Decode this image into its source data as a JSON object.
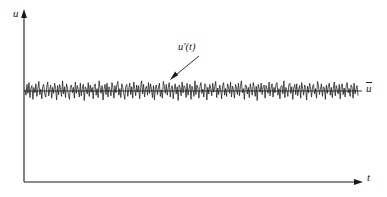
{
  "figure": {
    "type": "turbulent-velocity-signal",
    "background_color": "#ffffff",
    "line_color": "#1a1a1a"
  },
  "labels": {
    "y_axis": "u",
    "x_axis": "t",
    "signal": "u′(t)",
    "mean": "u"
  },
  "chart_data": {
    "type": "line",
    "title": "",
    "subtitle": "",
    "xlabel": "t",
    "ylabel": "u",
    "grid": false,
    "legend": "none",
    "annotations": [
      {
        "text": "u′(t)",
        "label_x_px": 178,
        "label_y_px": 42,
        "arrow_from_px": [
          199,
          56
        ],
        "arrow_to_px": [
          171,
          79
        ]
      },
      {
        "text": "ū",
        "label_x_px": 366,
        "label_y_px": 83,
        "meaning": "time-averaged mean velocity"
      }
    ],
    "axes_px": {
      "origin": [
        24,
        182
      ],
      "y_axis_top": [
        24,
        12
      ],
      "x_axis_right": [
        362,
        182
      ],
      "arrowheads": true
    },
    "series": [
      {
        "name": "mean",
        "style": "solid-horizontal",
        "y_px": 91,
        "x_start_px": 24,
        "x_end_px": 362,
        "value": 0
      },
      {
        "name": "u'(t)",
        "style": "solid-noise",
        "description": "high-frequency random turbulent fluctuation about the mean",
        "x_start_px": 25,
        "x_end_px": 358,
        "mean_y_px": 91,
        "amplitude_px": 12,
        "samples": 336,
        "values": [
          0.1,
          -0.35,
          0.55,
          -0.2,
          0.7,
          -0.55,
          0.25,
          0.45,
          -0.7,
          0.3,
          -0.15,
          0.6,
          -0.45,
          0.2,
          0.8,
          -0.3,
          0.15,
          -0.65,
          0.4,
          0.55,
          -0.25,
          -0.5,
          0.35,
          0.75,
          -0.4,
          0.1,
          0.5,
          -0.6,
          0.3,
          -0.2,
          0.65,
          0.2,
          -0.75,
          0.45,
          -0.3,
          0.55,
          0.15,
          -0.45,
          0.85,
          -0.25,
          0.35,
          -0.55,
          0.6,
          0.25,
          -0.35,
          -0.7,
          0.4,
          0.5,
          -0.15,
          0.3,
          -0.6,
          0.75,
          -0.2,
          0.45,
          0.1,
          -0.5,
          0.65,
          -0.4,
          0.2,
          0.55,
          -0.8,
          0.35,
          0.15,
          -0.25,
          0.7,
          -0.45,
          0.5,
          -0.1,
          0.3,
          -0.65,
          0.4,
          0.6,
          -0.35,
          0.2,
          -0.55,
          0.85,
          0.25,
          -0.2,
          0.45,
          -0.75,
          0.15,
          0.55,
          -0.3,
          0.65,
          -0.5,
          0.35,
          0.1,
          -0.4,
          0.7,
          0.25,
          -0.6,
          0.45,
          -0.15,
          0.5,
          0.8,
          -0.35,
          0.2,
          -0.55,
          0.6,
          0.3,
          -0.25,
          -0.7,
          0.4,
          0.55,
          -0.45,
          0.15,
          0.65,
          -0.3,
          0.35,
          -0.6,
          0.75,
          0.2,
          -0.4,
          0.5,
          -0.1,
          0.45,
          -0.65,
          0.3,
          0.85,
          -0.25,
          0.55,
          -0.5,
          0.2,
          0.4,
          -0.35,
          0.7,
          -0.2,
          0.6,
          0.15,
          -0.55,
          0.45,
          -0.75,
          0.35,
          0.5,
          -0.3,
          0.25,
          0.65,
          -0.45,
          0.1,
          -0.6,
          0.8,
          0.4,
          -0.2,
          0.55,
          -0.35,
          0.3,
          0.7,
          -0.5,
          0.2,
          0.45,
          -0.65,
          0.15,
          0.6,
          -0.25,
          0.35,
          -0.8,
          0.5,
          0.25,
          -0.4,
          0.75,
          -0.15,
          0.45,
          0.3,
          -0.55,
          0.65,
          -0.35,
          0.2,
          0.55,
          -0.7,
          0.4,
          0.1,
          -0.45,
          0.85,
          -0.3,
          0.5,
          0.25,
          -0.6,
          0.35,
          0.7,
          -0.2,
          0.15,
          -0.5,
          0.6,
          0.45,
          -0.75,
          0.3,
          -0.25,
          0.55,
          0.2,
          -0.4,
          0.65,
          -0.1,
          0.35,
          0.8,
          -0.55,
          0.25,
          -0.3,
          0.5,
          0.15,
          -0.65,
          0.45,
          0.7,
          -0.35,
          0.2,
          -0.45,
          0.6,
          0.3,
          -0.2,
          0.75,
          -0.5,
          0.4,
          0.1,
          -0.6,
          0.55,
          0.25,
          -0.3,
          0.65,
          -0.4,
          0.35,
          0.85,
          -0.15,
          0.2,
          -0.7,
          0.5,
          0.45,
          -0.25,
          0.3,
          -0.55,
          0.6,
          0.15,
          -0.35,
          0.7,
          0.25,
          -0.45,
          0.4,
          -0.8,
          0.55,
          0.2,
          -0.1,
          0.65,
          -0.3,
          0.35,
          0.5,
          -0.6,
          0.45,
          0.15,
          -0.2,
          0.75,
          -0.4,
          0.25,
          0.6,
          -0.5,
          0.3,
          -0.15,
          0.55,
          0.7,
          -0.35,
          0.2,
          -0.65,
          0.4,
          0.45,
          -0.25,
          0.85,
          -0.55,
          0.3,
          0.1,
          -0.45,
          0.5,
          0.65,
          -0.2,
          0.35,
          -0.7,
          0.25,
          0.55,
          -0.3,
          0.6,
          -0.4,
          0.15,
          0.45,
          -0.6,
          0.7,
          0.2,
          -0.35,
          0.5,
          0.3,
          -0.75,
          0.4,
          -0.15,
          0.65,
          0.25,
          -0.5,
          0.35,
          0.55,
          -0.25,
          0.2,
          -0.6,
          0.8,
          0.45,
          -0.3,
          0.15,
          0.6,
          -0.45,
          0.35,
          0.25,
          -0.7,
          0.5,
          -0.2,
          0.4,
          0.65,
          -0.35,
          0.3,
          -0.55,
          0.2,
          0.75,
          -0.4,
          0.45,
          0.1,
          -0.25,
          0.55,
          -0.65,
          0.35,
          0.6,
          -0.3,
          0.25,
          -0.5,
          0.4,
          0.7,
          -0.15,
          0.2,
          -0.45,
          0.5,
          0.3,
          -0.6,
          0.65,
          -0.25,
          0.15,
          0.45,
          -0.35
        ]
      }
    ]
  }
}
